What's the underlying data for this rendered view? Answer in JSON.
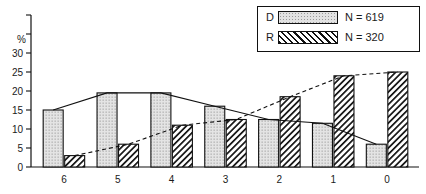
{
  "chart_data": {
    "type": "bar",
    "title": "",
    "xlabel": "",
    "ylabel": "%",
    "categories": [
      "6",
      "5",
      "4",
      "3",
      "2",
      "1",
      "0"
    ],
    "ylim": [
      0,
      40
    ],
    "yticks": [
      0,
      5,
      10,
      15,
      20,
      25,
      30,
      35,
      40
    ],
    "ytick_labels": [
      "0",
      "5",
      "10",
      "15",
      "20",
      "25",
      "30",
      "",
      ""
    ],
    "grid": false,
    "legend_position": "top-right",
    "series": [
      {
        "name": "D",
        "legend_key": "D",
        "legend_n": "N = 619",
        "fill": "dotted",
        "trend_line": "solid",
        "values": [
          15,
          19.5,
          19.5,
          16,
          12.5,
          11.5,
          6
        ]
      },
      {
        "name": "R",
        "legend_key": "R",
        "legend_n": "N = 320",
        "fill": "diagonal-hatch",
        "trend_line": "dashed",
        "values": [
          3,
          6,
          11,
          12.5,
          18.5,
          24,
          25
        ]
      }
    ]
  },
  "legend": {
    "rows": [
      {
        "key": "D",
        "n": "N = 619"
      },
      {
        "key": "R",
        "n": "N = 320"
      }
    ]
  },
  "axis": {
    "y_unit_label": "%"
  }
}
